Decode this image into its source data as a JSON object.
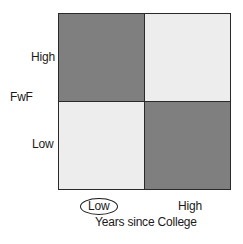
{
  "diagram": {
    "type": "2x2-quadrant-matrix",
    "y_axis": {
      "title": "FwF",
      "high_label": "High",
      "low_label": "Low"
    },
    "x_axis": {
      "title": "Years since College",
      "low_label": "Low",
      "high_label": "High",
      "highlighted": "Low"
    },
    "quadrants": [
      {
        "position": "top-left",
        "x": "Low",
        "y": "High",
        "shade": "dark",
        "color": "#7f7f7f"
      },
      {
        "position": "top-right",
        "x": "High",
        "y": "High",
        "shade": "light",
        "color": "#ededed"
      },
      {
        "position": "bottom-left",
        "x": "Low",
        "y": "Low",
        "shade": "light",
        "color": "#ededed"
      },
      {
        "position": "bottom-right",
        "x": "High",
        "y": "Low",
        "shade": "dark",
        "color": "#7f7f7f"
      }
    ],
    "colors": {
      "dark": "#7f7f7f",
      "light": "#ededed",
      "border": "#2a2a2a"
    }
  }
}
